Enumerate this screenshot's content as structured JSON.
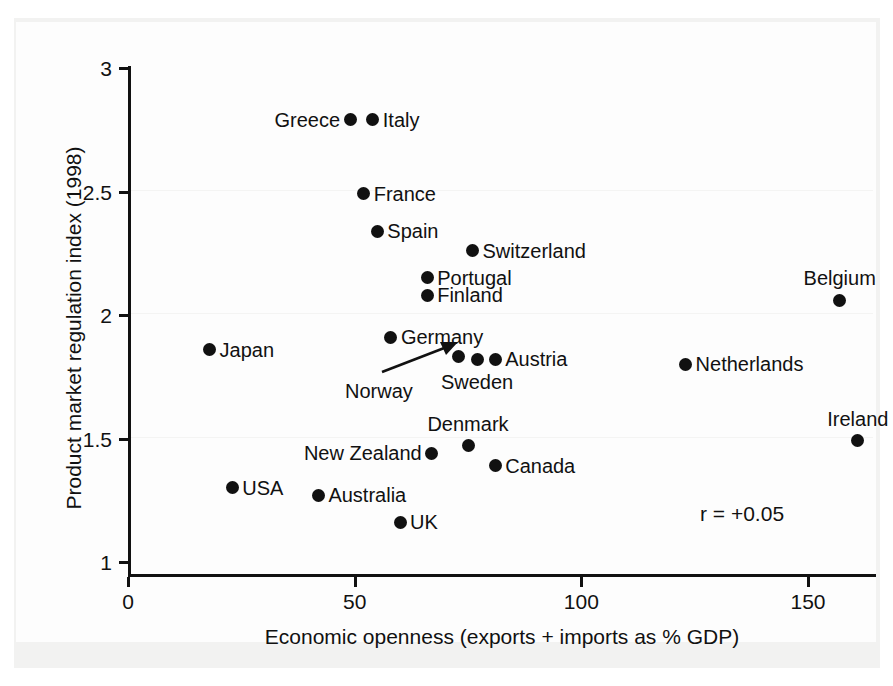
{
  "chart_data": {
    "type": "scatter",
    "title": "",
    "xlabel": "Economic openness (exports + imports as % GDP)",
    "ylabel": "Product market regulation index (1998)",
    "xlim": [
      0,
      165
    ],
    "ylim": [
      1,
      3
    ],
    "xticks": [
      0,
      50,
      100,
      150
    ],
    "xtick_labels": [
      "0",
      "50",
      "100",
      "150"
    ],
    "yticks": [
      1,
      1.5,
      2,
      2.5,
      3
    ],
    "ytick_labels": [
      "1",
      "1.5",
      "2",
      "2.5",
      "3"
    ],
    "grid": false,
    "legend": "none",
    "annotations": [
      {
        "text": "r = +0.05",
        "x": 190,
        "y": 1.29
      }
    ],
    "points": [
      {
        "label": "Greece",
        "x": 49,
        "y": 2.79,
        "label_pos": "left"
      },
      {
        "label": "Italy",
        "x": 54,
        "y": 2.79,
        "label_pos": "right"
      },
      {
        "label": "France",
        "x": 52,
        "y": 2.49,
        "label_pos": "right"
      },
      {
        "label": "Spain",
        "x": 55,
        "y": 2.34,
        "label_pos": "right"
      },
      {
        "label": "Switzerland",
        "x": 76,
        "y": 2.26,
        "label_pos": "right"
      },
      {
        "label": "Portugal",
        "x": 66,
        "y": 2.15,
        "label_pos": "right"
      },
      {
        "label": "Finland",
        "x": 66,
        "y": 2.08,
        "label_pos": "right"
      },
      {
        "label": "Belgium",
        "x": 157,
        "y": 2.06,
        "label_pos": "above"
      },
      {
        "label": "Germany",
        "x": 58,
        "y": 1.91,
        "label_pos": "right"
      },
      {
        "label": "Japan",
        "x": 18,
        "y": 1.86,
        "label_pos": "right"
      },
      {
        "label": "Norway",
        "x": 73,
        "y": 1.83,
        "label_pos": "arrow"
      },
      {
        "label": "Sweden",
        "x": 77,
        "y": 1.82,
        "label_pos": "below"
      },
      {
        "label": "Austria",
        "x": 81,
        "y": 1.82,
        "label_pos": "right"
      },
      {
        "label": "Netherlands",
        "x": 123,
        "y": 1.8,
        "label_pos": "right"
      },
      {
        "label": "Ireland",
        "x": 161,
        "y": 1.49,
        "label_pos": "above"
      },
      {
        "label": "Denmark",
        "x": 75,
        "y": 1.47,
        "label_pos": "above"
      },
      {
        "label": "New Zealand",
        "x": 67,
        "y": 1.44,
        "label_pos": "left"
      },
      {
        "label": "Canada",
        "x": 81,
        "y": 1.39,
        "label_pos": "right"
      },
      {
        "label": "USA",
        "x": 23,
        "y": 1.3,
        "label_pos": "right"
      },
      {
        "label": "Australia",
        "x": 42,
        "y": 1.27,
        "label_pos": "right"
      },
      {
        "label": "UK",
        "x": 60,
        "y": 1.16,
        "label_pos": "right"
      }
    ]
  },
  "colors": {
    "marker": "#111111",
    "axis": "#111111",
    "text": "#111111",
    "plot_background": "#fdfdfd",
    "page_background": "#ffffff"
  }
}
